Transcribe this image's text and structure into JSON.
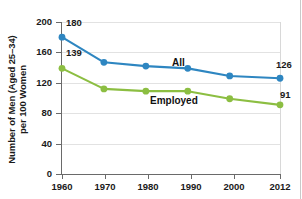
{
  "chart_data": {
    "type": "line",
    "title": "",
    "xlabel": "",
    "ylabel": "Number of Men (Aged 25–34) per 100 Women",
    "ylabel_line1": "Number of Men (Aged 25–34)",
    "ylabel_line2": "per 100 Women",
    "x": [
      1960,
      1970,
      1980,
      1990,
      2000,
      2012
    ],
    "categories": [
      "1960",
      "1970",
      "1980",
      "1990",
      "2000",
      "2012"
    ],
    "xtick_labels": [
      "1960",
      "1970",
      "1980",
      "1990",
      "2000",
      "2012"
    ],
    "ytick_labels": [
      "200",
      "160",
      "120",
      "80",
      "40",
      "0"
    ],
    "yticks": [
      200,
      160,
      120,
      80,
      40,
      0
    ],
    "ylim": [
      0,
      200
    ],
    "xlim": [
      1960,
      2012
    ],
    "grid": true,
    "grid_axis": "y",
    "legend": "inline-series-labels",
    "series": [
      {
        "name": "All",
        "color": "#2e86c1",
        "values": [
          180,
          147,
          142,
          139,
          129,
          126
        ],
        "label_start": "180",
        "label_end": "126"
      },
      {
        "name": "Employed",
        "color": "#8cbe42",
        "values": [
          139,
          112,
          109,
          109,
          99,
          91
        ],
        "label_start": "139",
        "label_end": "91"
      }
    ],
    "annotations": [
      {
        "text": "180",
        "series": "All",
        "point": 1960
      },
      {
        "text": "126",
        "series": "All",
        "point": 2012
      },
      {
        "text": "139",
        "series": "Employed",
        "point": 1960
      },
      {
        "text": "91",
        "series": "Employed",
        "point": 2012
      },
      {
        "text": "All",
        "series": "All",
        "kind": "series-name"
      },
      {
        "text": "Employed",
        "series": "Employed",
        "kind": "series-name"
      }
    ],
    "colors": {
      "all_series": "#2e86c1",
      "employed_series": "#8cbe42",
      "axis": "#6a6a6a",
      "gridline": "#e2e2e2",
      "text": "#1a1a1a",
      "background": "#ffffff"
    }
  }
}
